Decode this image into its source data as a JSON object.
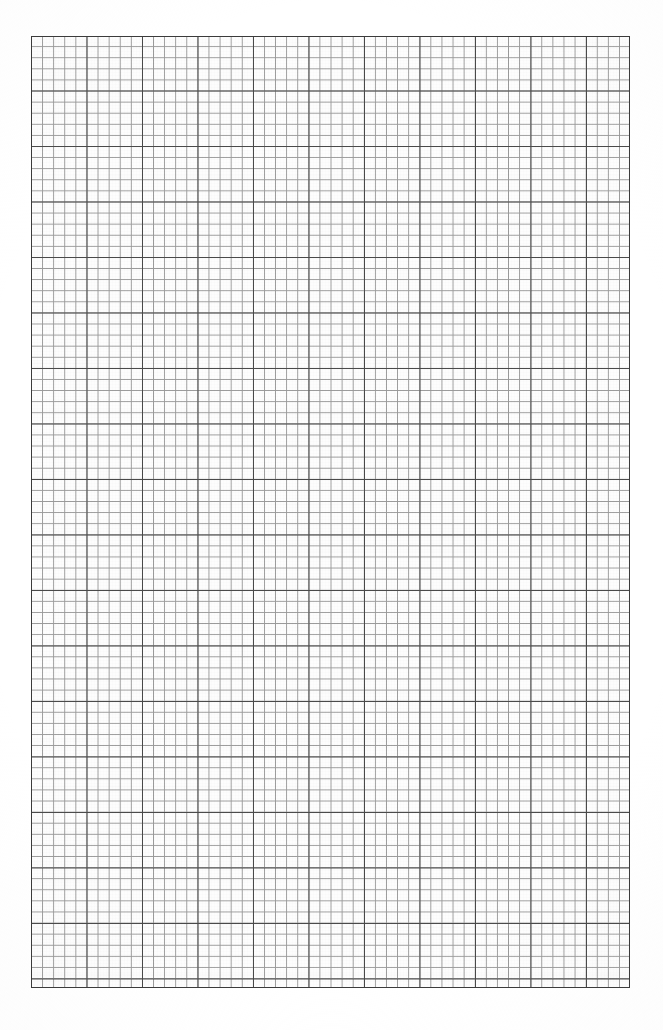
{
  "page": {
    "title": "Graph Paper Sheet",
    "width": 663,
    "height": 1030,
    "background_color": "#ffffff"
  },
  "chart_data": {
    "type": "table",
    "title": "",
    "subtitle": "",
    "xlabel": "",
    "ylabel": "",
    "categories": [],
    "values": [],
    "grid": {
      "visible": true,
      "left_px": 31,
      "top_px": 36,
      "right_px": 630,
      "bottom_px": 988,
      "width_px": 599,
      "height_px": 952,
      "minor_cell_px": 11.1,
      "major_cell_px": 55.5,
      "minor_per_major": 5,
      "minor_columns": 54,
      "minor_rows": 86,
      "major_columns": 10.8,
      "major_rows": 17.2,
      "minor_line_color": "#9a9a9a",
      "major_line_color": "#4a4a4a",
      "border_color": "#3b3b3b",
      "cell_fill_color": "#fdfdfd",
      "minor_line_width_px": 1,
      "major_line_width_px": 1
    },
    "legend": {
      "visible": false,
      "position": "none",
      "entries": []
    },
    "annotations": [],
    "series": [],
    "data_points": 0
  },
  "margins": {
    "left_px": 31,
    "top_px": 36,
    "right_px": 33,
    "bottom_px": 42,
    "color": "#ffffff"
  }
}
